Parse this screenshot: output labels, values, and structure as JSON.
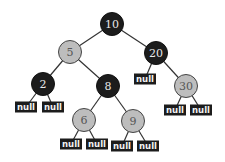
{
  "diagram": {
    "type": "binary-tree",
    "nodes": [
      {
        "id": "n10",
        "label": "10",
        "color": "dark",
        "x": 112,
        "y": 24
      },
      {
        "id": "n5",
        "label": "5",
        "color": "light",
        "x": 70,
        "y": 52
      },
      {
        "id": "n20",
        "label": "20",
        "color": "dark",
        "x": 156,
        "y": 53
      },
      {
        "id": "n2",
        "label": "2",
        "color": "dark",
        "x": 43,
        "y": 84
      },
      {
        "id": "n8",
        "label": "8",
        "color": "dark",
        "x": 108,
        "y": 86
      },
      {
        "id": "n30",
        "label": "30",
        "color": "light",
        "x": 186,
        "y": 86
      },
      {
        "id": "n6",
        "label": "6",
        "color": "light",
        "x": 84,
        "y": 120
      },
      {
        "id": "n9",
        "label": "9",
        "color": "light",
        "x": 133,
        "y": 121
      }
    ],
    "nulls": [
      {
        "id": "null-20-left",
        "label": "null",
        "x": 145,
        "y": 79
      },
      {
        "id": "null-2-left",
        "label": "null",
        "x": 26,
        "y": 107
      },
      {
        "id": "null-2-right",
        "label": "null",
        "x": 53,
        "y": 107
      },
      {
        "id": "null-30-left",
        "label": "null",
        "x": 175,
        "y": 110
      },
      {
        "id": "null-30-right",
        "label": "null",
        "x": 201,
        "y": 110
      },
      {
        "id": "null-6-left",
        "label": "null",
        "x": 71,
        "y": 144
      },
      {
        "id": "null-6-right",
        "label": "null",
        "x": 97,
        "y": 144
      },
      {
        "id": "null-9-left",
        "label": "null",
        "x": 122,
        "y": 146
      },
      {
        "id": "null-9-right",
        "label": "null",
        "x": 148,
        "y": 146
      }
    ],
    "edges": [
      [
        "n10",
        "n5"
      ],
      [
        "n10",
        "n20"
      ],
      [
        "n5",
        "n2"
      ],
      [
        "n5",
        "n8"
      ],
      [
        "n20",
        "null-20-left"
      ],
      [
        "n20",
        "n30"
      ],
      [
        "n2",
        "null-2-left"
      ],
      [
        "n2",
        "null-2-right"
      ],
      [
        "n8",
        "n6"
      ],
      [
        "n8",
        "n9"
      ],
      [
        "n30",
        "null-30-left"
      ],
      [
        "n30",
        "null-30-right"
      ],
      [
        "n6",
        "null-6-left"
      ],
      [
        "n6",
        "null-6-right"
      ],
      [
        "n9",
        "null-9-left"
      ],
      [
        "n9",
        "null-9-right"
      ]
    ],
    "colors": {
      "dark": "#1c1c1c",
      "light": "#bdbdbd",
      "edge": "#333333"
    }
  }
}
